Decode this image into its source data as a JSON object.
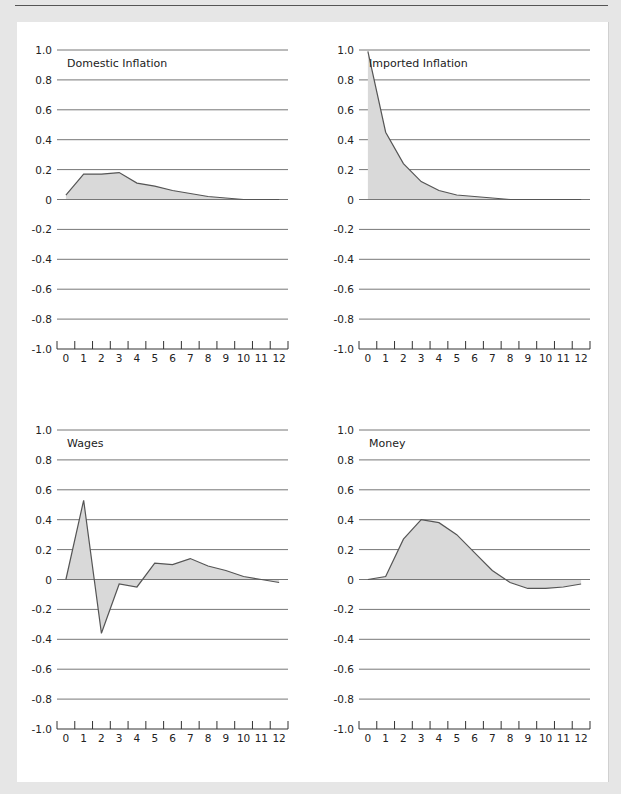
{
  "chart_data": [
    {
      "type": "area",
      "title": "Domestic Inflation",
      "x": [
        0,
        1,
        2,
        3,
        4,
        5,
        6,
        7,
        8,
        9,
        10,
        11,
        12
      ],
      "values": [
        0.03,
        0.17,
        0.17,
        0.18,
        0.11,
        0.09,
        0.06,
        0.04,
        0.02,
        0.01,
        0,
        0,
        0
      ],
      "ylim": [
        -1.0,
        1.0
      ],
      "yticks": [
        "1.0",
        "0.8",
        "0.6",
        "0.4",
        "0.2",
        "0",
        "-0.2",
        "-0.4",
        "-0.6",
        "-0.8",
        "-1.0"
      ],
      "xticks": [
        "0",
        "1",
        "2",
        "3",
        "4",
        "5",
        "6",
        "7",
        "8",
        "9",
        "10",
        "11",
        "12"
      ],
      "grid": true
    },
    {
      "type": "area",
      "title": "Imported Inflation",
      "x": [
        0,
        1,
        2,
        3,
        4,
        5,
        6,
        7,
        8,
        9,
        10,
        11,
        12
      ],
      "values": [
        0.99,
        0.45,
        0.24,
        0.12,
        0.06,
        0.03,
        0.02,
        0.01,
        0,
        0,
        0,
        0,
        0
      ],
      "ylim": [
        -1.0,
        1.0
      ],
      "yticks": [
        "1.0",
        "0.8",
        "0.6",
        "0.4",
        "0.2",
        "0",
        "-0.2",
        "-0.4",
        "-0.6",
        "-0.8",
        "-1.0"
      ],
      "xticks": [
        "0",
        "1",
        "2",
        "3",
        "4",
        "5",
        "6",
        "7",
        "8",
        "9",
        "10",
        "11",
        "12"
      ],
      "grid": true
    },
    {
      "type": "area",
      "title": "Wages",
      "x": [
        0,
        1,
        2,
        3,
        4,
        5,
        6,
        7,
        8,
        9,
        10,
        11,
        12
      ],
      "values": [
        0,
        0.53,
        -0.36,
        -0.03,
        -0.05,
        0.11,
        0.1,
        0.14,
        0.09,
        0.06,
        0.02,
        0,
        -0.02
      ],
      "ylim": [
        -1.0,
        1.0
      ],
      "yticks": [
        "1.0",
        "0.8",
        "0.6",
        "0.4",
        "0.2",
        "0",
        "-0.2",
        "-0.4",
        "-0.6",
        "-0.8",
        "-1.0"
      ],
      "xticks": [
        "0",
        "1",
        "2",
        "3",
        "4",
        "5",
        "6",
        "7",
        "8",
        "9",
        "10",
        "11",
        "12"
      ],
      "grid": true
    },
    {
      "type": "area",
      "title": "Money",
      "x": [
        0,
        1,
        2,
        3,
        4,
        5,
        6,
        7,
        8,
        9,
        10,
        11,
        12
      ],
      "values": [
        0,
        0.02,
        0.27,
        0.4,
        0.38,
        0.3,
        0.18,
        0.06,
        -0.02,
        -0.06,
        -0.06,
        -0.05,
        -0.03
      ],
      "ylim": [
        -1.0,
        1.0
      ],
      "yticks": [
        "1.0",
        "0.8",
        "0.6",
        "0.4",
        "0.2",
        "0",
        "-0.2",
        "-0.4",
        "-0.6",
        "-0.8",
        "-1.0"
      ],
      "xticks": [
        "0",
        "1",
        "2",
        "3",
        "4",
        "5",
        "6",
        "7",
        "8",
        "9",
        "10",
        "11",
        "12"
      ],
      "grid": true
    }
  ],
  "colors": {
    "fill": "#d9d9d9",
    "line": "#555555",
    "grid": "#777777",
    "background": "#e6e6e6",
    "panel": "#ffffff"
  }
}
